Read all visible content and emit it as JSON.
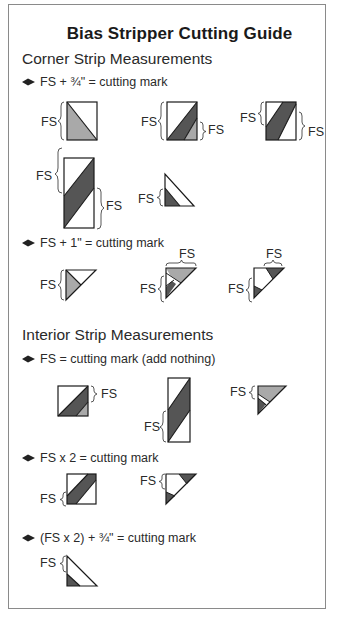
{
  "title": "Bias Stripper Cutting Guide",
  "sections": [
    {
      "heading": "Corner Strip Measurements",
      "rules": [
        {
          "text": "FS + ¾\" = cutting mark"
        },
        {
          "text": "FS + 1\" = cutting mark"
        }
      ]
    },
    {
      "heading": "Interior Strip Measurements",
      "rules": [
        {
          "text": "FS = cutting mark (add nothing)"
        },
        {
          "text": "FS x 2 = cutting mark"
        },
        {
          "text": "(FS x 2) + ¾\" = cutting mark"
        }
      ]
    }
  ],
  "fs_label": "FS",
  "icons": {
    "bullet": "diamond-bullet-icon",
    "brace": "curly-brace-icon"
  },
  "colors": {
    "frame": "#8a8a8a",
    "dark_fill": "#555555",
    "light_fill": "#a9a9a9",
    "outline": "#1a1a1a"
  }
}
